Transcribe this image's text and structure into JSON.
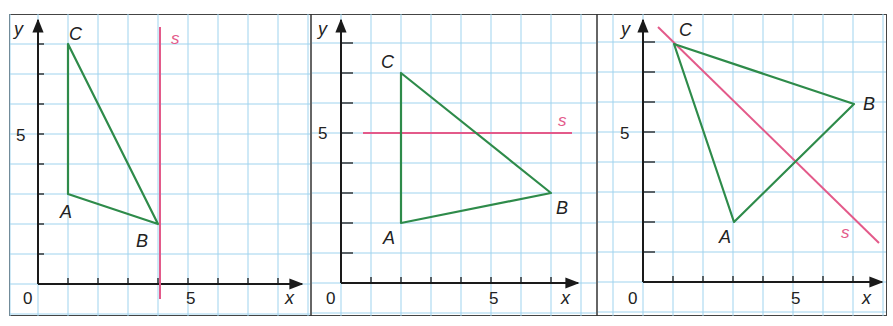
{
  "figure": {
    "grid_unit_px": 30,
    "colors": {
      "grid": "#9fd3ee",
      "axis": "#1a1a1a",
      "triangle": "#2e8b4a",
      "triangle_highlight": "#d8e84a",
      "line_s": "#e35a8a",
      "frame": "#444444"
    },
    "panels": [
      {
        "id": 1,
        "axis_labels": {
          "x": "x",
          "y": "y"
        },
        "tick_labels": {
          "origin": "0",
          "x5": "5",
          "y5": "5"
        },
        "points": {
          "A": {
            "label": "A",
            "x": 1,
            "y": 3
          },
          "B": {
            "label": "B",
            "x": 4,
            "y": 2
          },
          "C": {
            "label": "C",
            "x": 1,
            "y": 8
          }
        },
        "line_s": {
          "label": "s",
          "description": "vertical line x = 4"
        }
      },
      {
        "id": 2,
        "axis_labels": {
          "x": "x",
          "y": "y"
        },
        "tick_labels": {
          "origin": "0",
          "x5": "5",
          "y5": "5"
        },
        "points": {
          "A": {
            "label": "A",
            "x": 2,
            "y": 2
          },
          "B": {
            "label": "B",
            "x": 7,
            "y": 3
          },
          "C": {
            "label": "C",
            "x": 2,
            "y": 7
          }
        },
        "line_s": {
          "label": "s",
          "description": "horizontal line y = 5"
        }
      },
      {
        "id": 3,
        "axis_labels": {
          "x": "x",
          "y": "y"
        },
        "tick_labels": {
          "origin": "0",
          "x5": "5",
          "y5": "5"
        },
        "points": {
          "A": {
            "label": "A",
            "x": 3,
            "y": 2
          },
          "B": {
            "label": "B",
            "x": 7,
            "y": 6
          },
          "C": {
            "label": "C",
            "x": 1,
            "y": 8
          }
        },
        "line_s": {
          "label": "s",
          "description": "line y = -x + 9"
        }
      }
    ]
  }
}
